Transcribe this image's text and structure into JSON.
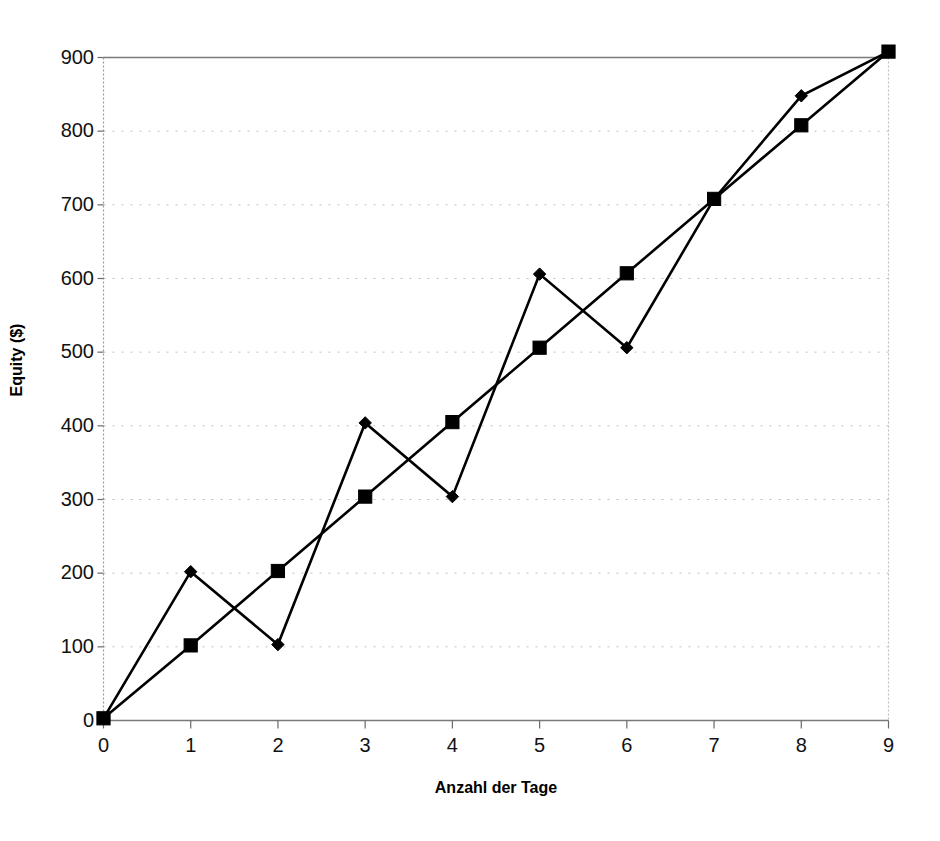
{
  "chart_data": {
    "type": "line",
    "title": "",
    "xlabel": "Anzahl der Tage",
    "ylabel": "Equity ($)",
    "x": [
      0,
      1,
      2,
      3,
      4,
      5,
      6,
      7,
      8,
      9
    ],
    "xlim": [
      0,
      9
    ],
    "ylim": [
      0,
      900
    ],
    "xticks": [
      "0",
      "1",
      "2",
      "3",
      "4",
      "5",
      "6",
      "7",
      "8",
      "9"
    ],
    "yticks": [
      "0",
      "100",
      "200",
      "300",
      "400",
      "500",
      "600",
      "700",
      "800",
      "900"
    ],
    "grid": "horizontal-dotted",
    "legend": "none",
    "series": [
      {
        "name": "series-diamond",
        "marker": "diamond",
        "values": [
          3,
          202,
          103,
          404,
          304,
          606,
          506,
          708,
          848,
          908
        ]
      },
      {
        "name": "series-square",
        "marker": "square",
        "values": [
          3,
          102,
          203,
          304,
          405,
          506,
          607,
          708,
          808,
          908
        ]
      }
    ]
  },
  "axis": {
    "y_label_text": "Equity ($)",
    "x_label_text": "Anzahl der Tage"
  },
  "colors": {
    "line": "#000000",
    "marker": "#000000",
    "grid": "#bfbfbf",
    "axis": "#7a7a7a",
    "background": "#ffffff"
  }
}
